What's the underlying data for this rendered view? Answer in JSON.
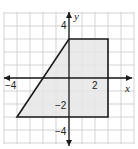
{
  "diagram": {
    "type": "coordinate-plane-polygon",
    "axes": {
      "x_label": "x",
      "y_label": "y",
      "x_ticks_labeled": [
        {
          "value": -4,
          "label": "−4"
        },
        {
          "value": 2,
          "label": "2"
        }
      ],
      "y_ticks_labeled": [
        {
          "value": 4,
          "label": "4"
        },
        {
          "value": -2,
          "label": "−2"
        },
        {
          "value": -4,
          "label": "−4"
        }
      ],
      "grid_unit": 1,
      "x_range": [
        -5,
        5
      ],
      "y_range": [
        -5,
        5
      ]
    },
    "polygon": {
      "vertices": [
        [
          0,
          3
        ],
        [
          3,
          3
        ],
        [
          3,
          -3
        ],
        [
          -4,
          -3
        ]
      ],
      "fill": "#e6e6e6",
      "stroke": "#1a1a1a"
    },
    "colors": {
      "grid": "#c8c8c8",
      "axis": "#1a1a1a",
      "background": "#ffffff"
    }
  }
}
